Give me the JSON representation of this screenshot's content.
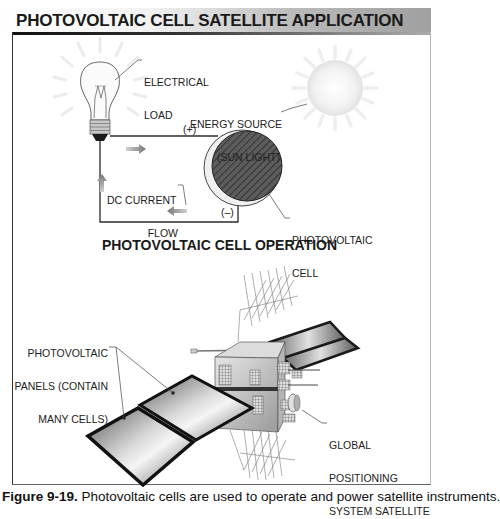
{
  "header": {
    "title": "PHOTOVOLTAIC CELL SATELLITE APPLICATION"
  },
  "operation_diagram": {
    "subtitle": "PHOTOVOLTAIC CELL OPERATION",
    "labels": {
      "load_line1": "ELECTRICAL",
      "load_line2": "LOAD",
      "source_line1": "ENERGY SOURCE",
      "source_line2": "(SUN LIGHT)",
      "positive": "(+)",
      "negative": "(–)",
      "flow_line1": "DC CURRENT",
      "flow_line2": "FLOW",
      "cell_line1": "PHOTOVOLTAIC",
      "cell_line2": "CELL"
    },
    "icons": [
      "light-bulb-icon",
      "sun-icon",
      "photovoltaic-cell-icon",
      "current-arrow-icon"
    ]
  },
  "satellite_diagram": {
    "labels": {
      "panels_line1": "PHOTOVOLTAIC",
      "panels_line2": "PANELS (CONTAIN",
      "panels_line3": "MANY CELLS)",
      "gps_line1": "GLOBAL",
      "gps_line2": "POSITIONING",
      "gps_line3": "SYSTEM SATELLITE"
    }
  },
  "caption": {
    "figure": "Figure 9-19.",
    "text": "Photovoltaic cells are used to operate and power satellite instruments."
  },
  "colors": {
    "ink": "#1a1a1a",
    "panel_dark": "#222222",
    "panel_mid": "#9a9a9a",
    "cell_fill": "#5a5a5a",
    "arrow_gray": "#888888"
  }
}
